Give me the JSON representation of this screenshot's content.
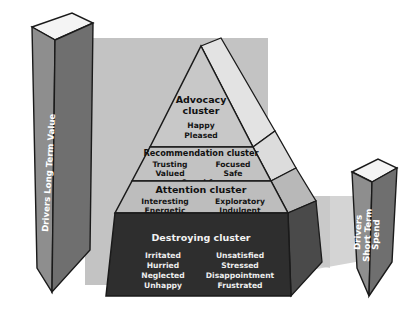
{
  "diagram": {
    "title_hidden": "",
    "left_panel": {
      "label": "Drivers Long Term Value"
    },
    "right_panel": {
      "line1": "Drivers",
      "line2": "Short Term",
      "line3": "Spend"
    },
    "tiers": [
      {
        "id": "advocacy",
        "title": "Advocacy cluster",
        "title_line1": "Advocacy",
        "title_line2": "cluster",
        "left_words": [
          "Happy",
          "Pleased"
        ],
        "right_words": [],
        "center_words": [],
        "fill": "#c8c8c8",
        "text_color": "#111111"
      },
      {
        "id": "recommendation",
        "title": "Recommendation cluster",
        "left_words": [
          "Trusting",
          "Valued"
        ],
        "right_words": [
          "Focused",
          "Safe"
        ],
        "center_words": [
          "Cared for"
        ],
        "fill": "#c2c2c2",
        "text_color": "#111111"
      },
      {
        "id": "attention",
        "title": "Attention cluster",
        "left_words": [
          "Interesting",
          "Energetic"
        ],
        "right_words": [
          "Exploratory",
          "Indulgent"
        ],
        "center_words": [
          "Stimulated"
        ],
        "fill": "#bdbdbd",
        "text_color": "#111111"
      },
      {
        "id": "destroying",
        "title": "Destroying cluster",
        "left_words": [
          "Irritated",
          "Hurried",
          "Neglected",
          "Unhappy"
        ],
        "right_words": [
          "Unsatisfied",
          "Stressed",
          "Disappointment",
          "Frustrated"
        ],
        "center_words": [],
        "fill": "#2e2e2e",
        "text_color": "#f0f0f0"
      }
    ],
    "colors": {
      "background": "#ffffff",
      "backdrop_slab": "#c4c4c4",
      "right_slab": "#cdcdcd",
      "panel_front": "#8e8e8e",
      "panel_side": "#6f6f6f",
      "panel_top": "#f4f4f4",
      "outline": "#1a1a1a",
      "pyramid_side_light": "#e0e0e0",
      "pyramid_side_mid": "#b0b0b0",
      "pyramid_side_dark": "#4a4a4a"
    }
  }
}
